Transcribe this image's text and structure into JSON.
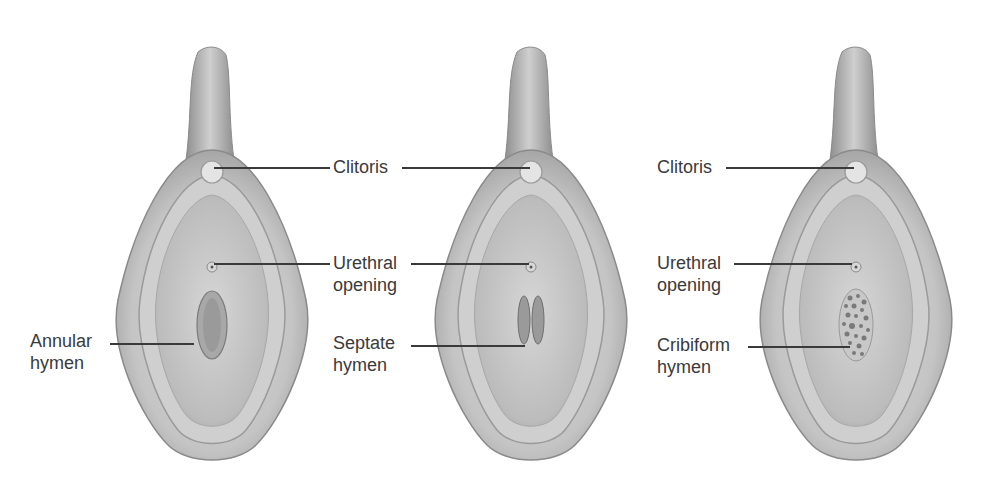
{
  "figures": [
    {
      "id": "annular",
      "labels": {
        "hymen": [
          "Annular",
          "hymen"
        ]
      }
    },
    {
      "id": "septate",
      "labels": {
        "clitoris": "Clitoris",
        "urethral": [
          "Urethral",
          "opening"
        ],
        "hymen": [
          "Septate",
          "hymen"
        ]
      }
    },
    {
      "id": "cribiform",
      "labels": {
        "clitoris": "Clitoris",
        "urethral": [
          "Urethral",
          "opening"
        ],
        "hymen": [
          "Cribiform",
          "hymen"
        ]
      }
    }
  ],
  "colors": {
    "background": "#ffffff",
    "text": "#3a3a3a",
    "tissue_light": "#d8d8d8",
    "tissue_mid": "#b5b5b5",
    "tissue_dark": "#8a8a8a"
  }
}
